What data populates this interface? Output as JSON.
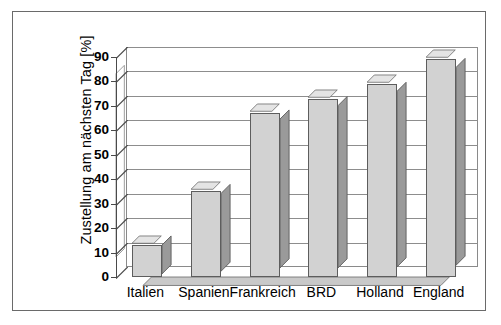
{
  "chart_data": {
    "type": "bar",
    "title": "",
    "subtitle": "",
    "xlabel": "",
    "ylabel": "Zustellung am nächsten Tag [%]",
    "categories": [
      "Italien",
      "Spanien",
      "Frankreich",
      "BRD",
      "Holland",
      "England"
    ],
    "values": [
      13,
      35,
      67,
      73,
      79,
      89
    ],
    "ylim": [
      0,
      90
    ],
    "ytick_labels": [
      "0",
      "10",
      "20",
      "30",
      "40",
      "50",
      "60",
      "70",
      "80",
      "90"
    ],
    "ytick_values": [
      0,
      10,
      20,
      30,
      40,
      50,
      60,
      70,
      80,
      90
    ],
    "grid": true,
    "legend": false,
    "legend_position": "none",
    "style": "3d-column",
    "colors": {
      "bar_front": "#d2d2d2",
      "bar_side": "#9a9a9a",
      "bar_top": "#e4e4e4",
      "bar_outline": "#5d5d5d",
      "gridline": "#8d8d8d",
      "axis": "#4a4a4a",
      "frame": "#6a6a6a",
      "background": "#ffffff",
      "text": "#000000"
    }
  }
}
